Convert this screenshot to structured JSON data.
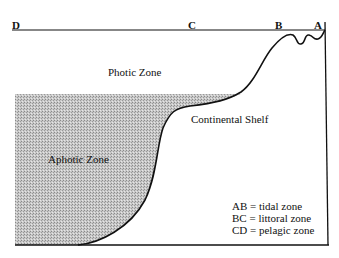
{
  "diagram": {
    "type": "ocean-zones-cross-section",
    "points": {
      "D": "D",
      "C": "C",
      "B": "B",
      "A": "A"
    },
    "regions": {
      "photic": "Photic Zone",
      "aphotic": "Aphotic Zone",
      "shelf": "Continental Shelf"
    },
    "legend": [
      "AB = tidal zone",
      "BC = littoral zone",
      "CD = pelagic zone"
    ],
    "colors": {
      "line": "#111111",
      "aphotic_fill": "#b8b8b8",
      "background": "#ffffff"
    }
  }
}
